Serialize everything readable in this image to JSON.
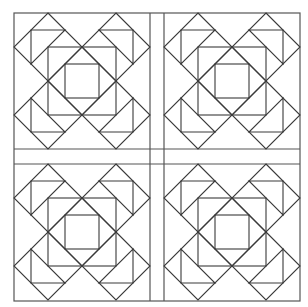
{
  "diagram": {
    "type": "quilt-block-pattern",
    "canvas": {
      "width": 308,
      "height": 307,
      "background": "#ffffff"
    },
    "colors": {
      "line": "#3a3a3a",
      "frame": "#555555"
    },
    "frame": {
      "x": 14,
      "y": 13,
      "right": 300,
      "bottom": 301
    },
    "block_size": 136,
    "blocks": [
      {
        "id": "block-top-left",
        "x": 14,
        "y": 13
      },
      {
        "id": "block-top-right",
        "x": 164,
        "y": 13
      },
      {
        "id": "block-bottom-left",
        "x": 14,
        "y": 164
      },
      {
        "id": "block-bottom-right",
        "x": 164,
        "y": 164
      }
    ],
    "sashing": {
      "vertical": [
        150,
        164
      ],
      "horizontal": [
        149,
        164
      ]
    },
    "block_elements": {
      "corner_diamonds": 4,
      "center_diamond": 1,
      "medium_square": 1,
      "inner_square": 1,
      "corner_triangles": 4
    }
  }
}
